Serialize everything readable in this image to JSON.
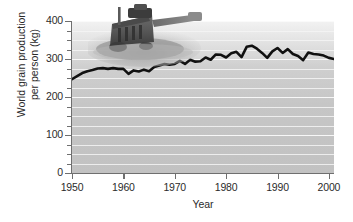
{
  "chart_data": {
    "type": "line",
    "title": "",
    "xlabel": "Year",
    "ylabel": "World grain production per person (kg)",
    "ylabel_line1": "World grain production",
    "ylabel_line2": "per person (kg)",
    "xlim": [
      1950,
      2001
    ],
    "ylim": [
      0,
      400
    ],
    "xticks": [
      1950,
      1960,
      1970,
      1980,
      1990,
      2000
    ],
    "xtick_labels": [
      "1950",
      "1960",
      "1970",
      "1980",
      "1990",
      "2000"
    ],
    "yticks": [
      0,
      100,
      200,
      300,
      400
    ],
    "ytick_labels": [
      "0",
      "100",
      "200",
      "300",
      "400"
    ],
    "yticks_minor": [
      25,
      50,
      75,
      125,
      150,
      175,
      225,
      250,
      275,
      325,
      350,
      375
    ],
    "grid": true,
    "grid_axis": "y",
    "legend": "none",
    "line_color": "#111111",
    "line_width": 2.6,
    "plot_background": "#c8c8c8",
    "figure_background": "#ffffff",
    "axis_color": "#6f6f6f",
    "text_color": "#2b2b2b",
    "annotation_image": "combine-harvester-photo",
    "x": [
      1950,
      1951,
      1952,
      1953,
      1954,
      1955,
      1956,
      1957,
      1958,
      1959,
      1960,
      1961,
      1962,
      1963,
      1964,
      1965,
      1966,
      1967,
      1968,
      1969,
      1970,
      1971,
      1972,
      1973,
      1974,
      1975,
      1976,
      1977,
      1978,
      1979,
      1980,
      1981,
      1982,
      1983,
      1984,
      1985,
      1986,
      1987,
      1988,
      1989,
      1990,
      1991,
      1992,
      1993,
      1994,
      1995,
      1996,
      1997,
      1998,
      1999,
      2000,
      2001
    ],
    "values": [
      247,
      255,
      263,
      268,
      271,
      275,
      276,
      274,
      276,
      274,
      274,
      261,
      270,
      267,
      272,
      268,
      279,
      283,
      287,
      285,
      287,
      295,
      287,
      298,
      293,
      294,
      304,
      298,
      312,
      311,
      304,
      315,
      319,
      305,
      332,
      335,
      327,
      316,
      303,
      320,
      329,
      316,
      326,
      313,
      308,
      297,
      317,
      313,
      312,
      309,
      303,
      300
    ]
  }
}
